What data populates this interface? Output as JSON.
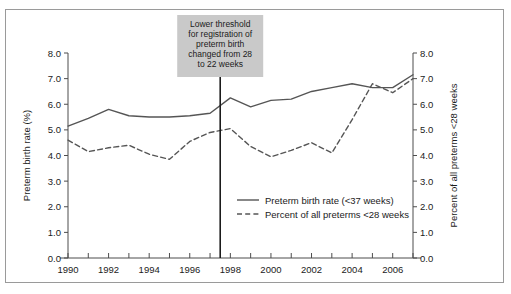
{
  "figure": {
    "background_color": "#ffffff",
    "frame_color": "#9a9a9a"
  },
  "annotation": {
    "name": "threshold-change-note",
    "box_fill": "#c9c9c9",
    "lines": [
      "Lower threshold",
      "for registration of",
      "preterm birth",
      "changed from 28",
      "to 22 weeks"
    ],
    "marker_year": 1997.5
  },
  "chart_data": {
    "type": "line",
    "title": "",
    "xlabel": "",
    "ylabel": "Preterm birth rate (%)",
    "y2label": "Percent of all preterms <28 weeks",
    "xlim": [
      1990,
      2007
    ],
    "ylim": [
      0.0,
      8.0
    ],
    "y2lim": [
      0.0,
      8.0
    ],
    "grid": false,
    "legend_position": "center-right",
    "x": [
      1990,
      1991,
      1992,
      1993,
      1994,
      1995,
      1996,
      1997,
      1998,
      1999,
      2000,
      2001,
      2002,
      2003,
      2004,
      2005,
      2006,
      2007
    ],
    "xtick_labels": [
      "1990",
      "1992",
      "1994",
      "1996",
      "1998",
      "2000",
      "2002",
      "2004",
      "2006"
    ],
    "xtick_values": [
      1990,
      1992,
      1994,
      1996,
      1998,
      2000,
      2002,
      2004,
      2006
    ],
    "ytick_labels": [
      "0.0",
      "1.0",
      "2.0",
      "3.0",
      "4.0",
      "5.0",
      "6.0",
      "7.0",
      "8.0"
    ],
    "ytick_values": [
      0.0,
      1.0,
      2.0,
      3.0,
      4.0,
      5.0,
      6.0,
      7.0,
      8.0
    ],
    "y2tick_labels": [
      "0.0",
      "1.0",
      "2.0",
      "3.0",
      "4.0",
      "5.0",
      "6.0",
      "7.0",
      "8.0"
    ],
    "y2tick_values": [
      0.0,
      1.0,
      2.0,
      3.0,
      4.0,
      5.0,
      6.0,
      7.0,
      8.0
    ],
    "series": [
      {
        "name": "Preterm birth rate (<37 weeks)",
        "style": "solid",
        "color": "#555555",
        "axis": "left",
        "values": [
          5.15,
          5.45,
          5.8,
          5.55,
          5.5,
          5.5,
          5.55,
          5.65,
          6.25,
          5.9,
          6.15,
          6.2,
          6.5,
          6.65,
          6.8,
          6.65,
          6.65,
          7.15
        ]
      },
      {
        "name": "Percent of all preterms <28 weeks",
        "style": "dashed",
        "color": "#555555",
        "axis": "right",
        "values": [
          4.6,
          4.15,
          4.3,
          4.4,
          4.05,
          3.85,
          4.55,
          4.9,
          5.05,
          4.35,
          3.95,
          4.2,
          4.5,
          4.1,
          5.4,
          6.8,
          6.45,
          7.0
        ]
      }
    ],
    "vertical_marker": {
      "label": "threshold-change-line",
      "x": 1997.5,
      "color": "#1b1b1b"
    }
  }
}
